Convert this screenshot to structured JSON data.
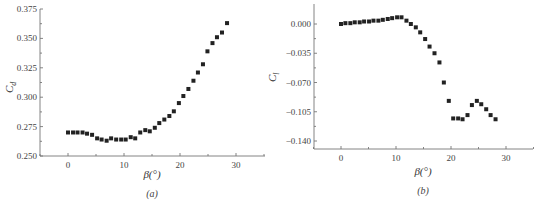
{
  "chart_data": [
    {
      "type": "scatter",
      "panel": "(a)",
      "title": "",
      "xlabel": "β(°)",
      "ylabel": "Cd",
      "xlim": [
        -5,
        35
      ],
      "ylim": [
        0.25,
        0.375
      ],
      "xticks": [
        "0",
        "10",
        "20",
        "30"
      ],
      "yticks": [
        "0.250",
        "0.275",
        "0.300",
        "0.325",
        "0.350",
        "0.375"
      ],
      "grid": false,
      "legend": null,
      "x": [
        0.0,
        0.9,
        1.7,
        2.6,
        3.4,
        4.3,
        5.2,
        6.0,
        6.9,
        7.7,
        8.6,
        9.5,
        10.3,
        11.2,
        12.0,
        12.9,
        13.8,
        14.6,
        15.5,
        16.3,
        17.2,
        18.1,
        18.9,
        19.8,
        20.6,
        21.5,
        22.4,
        23.2,
        24.1,
        24.9,
        25.8,
        26.6,
        27.5,
        28.4
      ],
      "values": [
        0.27,
        0.27,
        0.27,
        0.27,
        0.269,
        0.268,
        0.265,
        0.264,
        0.263,
        0.265,
        0.264,
        0.264,
        0.264,
        0.266,
        0.265,
        0.27,
        0.272,
        0.271,
        0.274,
        0.278,
        0.281,
        0.284,
        0.288,
        0.295,
        0.301,
        0.307,
        0.314,
        0.321,
        0.328,
        0.339,
        0.346,
        0.351,
        0.355,
        0.363
      ]
    },
    {
      "type": "scatter",
      "panel": "(b)",
      "title": "",
      "xlabel": "β(°)",
      "ylabel": "Cl",
      "xlim": [
        -5,
        35
      ],
      "ylim": [
        -0.15,
        0.02
      ],
      "xticks": [
        "0",
        "10",
        "20",
        "30"
      ],
      "yticks": [
        "0.000",
        "-0.035",
        "-0.070",
        "-0.105",
        "-0.140"
      ],
      "grid": false,
      "legend": null,
      "x": [
        0.0,
        0.8,
        1.7,
        2.5,
        3.4,
        4.2,
        5.1,
        5.9,
        6.8,
        7.6,
        8.5,
        9.3,
        10.2,
        11.0,
        11.9,
        12.7,
        13.6,
        14.4,
        15.3,
        16.1,
        17.0,
        17.9,
        18.7,
        19.6,
        20.4,
        21.3,
        22.1,
        23.0,
        23.8,
        24.7,
        25.5,
        26.4,
        27.2,
        28.1
      ],
      "values": [
        0.0,
        0.001,
        0.001,
        0.002,
        0.002,
        0.003,
        0.003,
        0.004,
        0.004,
        0.005,
        0.006,
        0.007,
        0.008,
        0.008,
        0.004,
        0.0,
        -0.004,
        -0.01,
        -0.018,
        -0.027,
        -0.035,
        -0.046,
        -0.07,
        -0.092,
        -0.113,
        -0.113,
        -0.114,
        -0.109,
        -0.097,
        -0.092,
        -0.096,
        -0.102,
        -0.109,
        -0.114,
        -0.121
      ]
    }
  ],
  "panels": {
    "a": {
      "caption": "(a)",
      "xlabel": "β(°)",
      "ylabel_main": "C",
      "ylabel_sub": "d",
      "xticks": [
        "0",
        "10",
        "20",
        "30"
      ],
      "yticks": [
        "0.375",
        "0.350",
        "0.325",
        "0.300",
        "0.275",
        "0.250"
      ]
    },
    "b": {
      "caption": "(b)",
      "xlabel": "β(°)",
      "ylabel_main": "C",
      "ylabel_sub": "l",
      "xticks": [
        "0",
        "10",
        "20",
        "30"
      ],
      "yticks": [
        "0.000",
        "−0.035",
        "−0.070",
        "−0.105",
        "−0.140"
      ]
    }
  }
}
